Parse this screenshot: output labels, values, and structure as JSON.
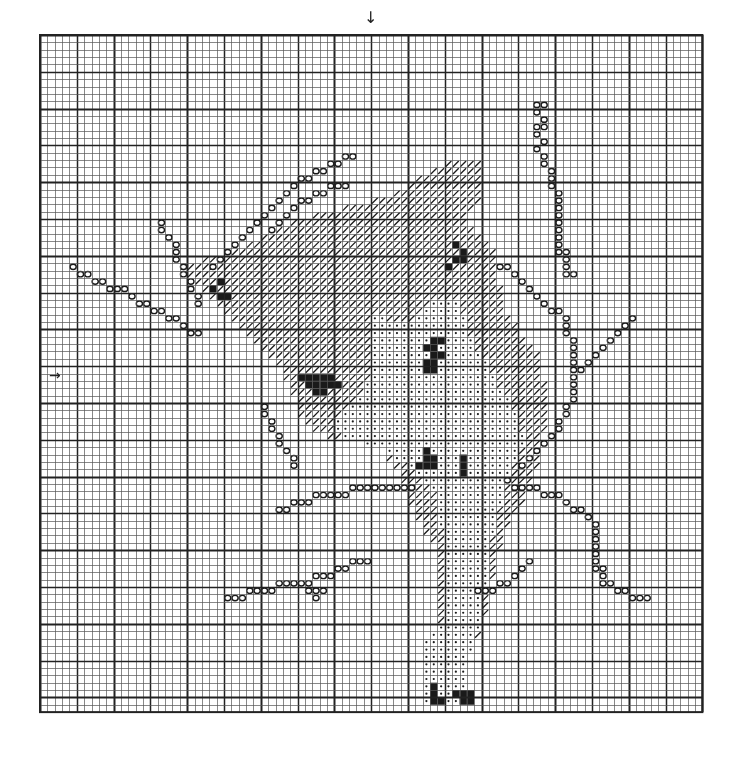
{
  "chart_title": "Cross-stitch pattern chart",
  "colors": {
    "grid_minor": "#555555",
    "grid_major": "#222222",
    "symbol_ink": "#1a1a1a",
    "background": "#ffffff"
  },
  "markers": {
    "center_top_arrow": "↓",
    "center_left_arrow": "→"
  },
  "grid": {
    "left": 40,
    "top": 35,
    "cols": 90,
    "rows": 92,
    "cell": 7.36,
    "major_every": 5,
    "heavy_every": 10
  },
  "legend_symbols": [
    {
      "id": "hatch",
      "name": "diagonal-hatch-symbol",
      "glyph": "/"
    },
    {
      "id": "dot",
      "name": "dot-symbol",
      "glyph": "·"
    },
    {
      "id": "circle",
      "name": "circle-symbol",
      "glyph": "o"
    },
    {
      "id": "solid",
      "name": "solid-black-symbol",
      "glyph": "■"
    }
  ],
  "regions": {
    "hatch": [
      [
        [
          25,
          30
        ],
        [
          35,
          25
        ],
        [
          47,
          22
        ],
        [
          56,
          17
        ],
        [
          60,
          17
        ],
        [
          60,
          22
        ],
        [
          58,
          25
        ],
        [
          62,
          30
        ],
        [
          63,
          37
        ],
        [
          68,
          44
        ],
        [
          69,
          50
        ],
        [
          68,
          58
        ],
        [
          66,
          63
        ],
        [
          63,
          68
        ],
        [
          62,
          72
        ],
        [
          60,
          82
        ],
        [
          57,
          85
        ],
        [
          54,
          84
        ],
        [
          54,
          70
        ],
        [
          51,
          65
        ],
        [
          49,
          60
        ],
        [
          46,
          55
        ],
        [
          40,
          55
        ],
        [
          36,
          53
        ],
        [
          34,
          48
        ],
        [
          32,
          44
        ],
        [
          28,
          40
        ],
        [
          24,
          36
        ],
        [
          20,
          33
        ],
        [
          19,
          32
        ],
        [
          20,
          31
        ]
      ]
    ],
    "dot": [
      [
        [
          45,
          38
        ],
        [
          50,
          39
        ],
        [
          54,
          36
        ],
        [
          57,
          36
        ],
        [
          58,
          40
        ],
        [
          61,
          45
        ],
        [
          64,
          50
        ],
        [
          66,
          55
        ],
        [
          63,
          62
        ],
        [
          61,
          70
        ],
        [
          60,
          80
        ],
        [
          58,
          86
        ],
        [
          58,
          91
        ],
        [
          52,
          91
        ],
        [
          52,
          83
        ],
        [
          55,
          80
        ],
        [
          55,
          70
        ],
        [
          54,
          63
        ],
        [
          52,
          60
        ],
        [
          49,
          58
        ],
        [
          46,
          56
        ],
        [
          42,
          55
        ],
        [
          39,
          53
        ],
        [
          43,
          50
        ],
        [
          45,
          46
        ]
      ]
    ],
    "solid_clusters": [
      [
        35,
        46
      ],
      [
        36,
        46
      ],
      [
        37,
        46
      ],
      [
        38,
        46
      ],
      [
        39,
        46
      ],
      [
        36,
        47
      ],
      [
        37,
        47
      ],
      [
        38,
        47
      ],
      [
        39,
        47
      ],
      [
        40,
        47
      ],
      [
        37,
        48
      ],
      [
        38,
        48
      ],
      [
        52,
        42
      ],
      [
        53,
        42
      ],
      [
        54,
        43
      ],
      [
        53,
        43
      ],
      [
        52,
        44
      ],
      [
        53,
        44
      ],
      [
        52,
        45
      ],
      [
        53,
        45
      ],
      [
        54,
        41
      ],
      [
        53,
        41
      ],
      [
        52,
        56
      ],
      [
        53,
        57
      ],
      [
        52,
        57
      ],
      [
        53,
        58
      ],
      [
        52,
        58
      ],
      [
        51,
        58
      ],
      [
        57,
        58
      ],
      [
        57,
        59
      ],
      [
        57,
        57
      ],
      [
        53,
        88
      ],
      [
        53,
        89
      ],
      [
        53,
        90
      ],
      [
        54,
        90
      ],
      [
        56,
        89
      ],
      [
        57,
        89
      ],
      [
        57,
        90
      ],
      [
        58,
        89
      ],
      [
        58,
        90
      ],
      [
        56,
        30
      ],
      [
        57,
        30
      ],
      [
        56,
        28
      ],
      [
        57,
        29
      ],
      [
        55,
        31
      ],
      [
        23,
        34
      ],
      [
        24,
        35
      ],
      [
        25,
        35
      ],
      [
        24,
        33
      ]
    ],
    "circles": [
      [
        4,
        31
      ],
      [
        5,
        32
      ],
      [
        6,
        32
      ],
      [
        7,
        33
      ],
      [
        8,
        33
      ],
      [
        9,
        34
      ],
      [
        10,
        34
      ],
      [
        11,
        34
      ],
      [
        12,
        35
      ],
      [
        13,
        36
      ],
      [
        14,
        36
      ],
      [
        15,
        37
      ],
      [
        16,
        37
      ],
      [
        17,
        38
      ],
      [
        18,
        38
      ],
      [
        19,
        39
      ],
      [
        20,
        40
      ],
      [
        21,
        40
      ],
      [
        16,
        25
      ],
      [
        16,
        26
      ],
      [
        17,
        27
      ],
      [
        18,
        28
      ],
      [
        18,
        29
      ],
      [
        18,
        30
      ],
      [
        19,
        31
      ],
      [
        19,
        32
      ],
      [
        20,
        33
      ],
      [
        20,
        34
      ],
      [
        21,
        35
      ],
      [
        21,
        36
      ],
      [
        23,
        31
      ],
      [
        24,
        30
      ],
      [
        25,
        29
      ],
      [
        26,
        28
      ],
      [
        27,
        27
      ],
      [
        28,
        26
      ],
      [
        29,
        25
      ],
      [
        30,
        24
      ],
      [
        31,
        23
      ],
      [
        32,
        22
      ],
      [
        33,
        21
      ],
      [
        34,
        20
      ],
      [
        35,
        19
      ],
      [
        36,
        19
      ],
      [
        37,
        18
      ],
      [
        38,
        18
      ],
      [
        39,
        17
      ],
      [
        40,
        17
      ],
      [
        41,
        16
      ],
      [
        42,
        16
      ],
      [
        31,
        26
      ],
      [
        32,
        25
      ],
      [
        33,
        24
      ],
      [
        34,
        23
      ],
      [
        35,
        22
      ],
      [
        36,
        22
      ],
      [
        37,
        21
      ],
      [
        38,
        21
      ],
      [
        39,
        20
      ],
      [
        40,
        20
      ],
      [
        41,
        20
      ],
      [
        30,
        50
      ],
      [
        30,
        51
      ],
      [
        31,
        52
      ],
      [
        31,
        53
      ],
      [
        32,
        54
      ],
      [
        32,
        55
      ],
      [
        33,
        56
      ],
      [
        34,
        57
      ],
      [
        34,
        58
      ],
      [
        67,
        9
      ],
      [
        68,
        9
      ],
      [
        67,
        10
      ],
      [
        68,
        11
      ],
      [
        67,
        12
      ],
      [
        68,
        12
      ],
      [
        67,
        13
      ],
      [
        68,
        14
      ],
      [
        67,
        15
      ],
      [
        68,
        16
      ],
      [
        68,
        17
      ],
      [
        69,
        18
      ],
      [
        69,
        19
      ],
      [
        69,
        20
      ],
      [
        70,
        21
      ],
      [
        70,
        22
      ],
      [
        70,
        23
      ],
      [
        70,
        24
      ],
      [
        70,
        25
      ],
      [
        70,
        26
      ],
      [
        70,
        27
      ],
      [
        70,
        28
      ],
      [
        70,
        29
      ],
      [
        71,
        29
      ],
      [
        71,
        30
      ],
      [
        71,
        31
      ],
      [
        71,
        32
      ],
      [
        72,
        32
      ],
      [
        62,
        31
      ],
      [
        63,
        31
      ],
      [
        64,
        32
      ],
      [
        65,
        33
      ],
      [
        66,
        34
      ],
      [
        67,
        35
      ],
      [
        68,
        36
      ],
      [
        69,
        37
      ],
      [
        70,
        37
      ],
      [
        71,
        38
      ],
      [
        71,
        39
      ],
      [
        71,
        40
      ],
      [
        72,
        41
      ],
      [
        72,
        42
      ],
      [
        72,
        43
      ],
      [
        72,
        44
      ],
      [
        72,
        45
      ],
      [
        72,
        46
      ],
      [
        72,
        47
      ],
      [
        72,
        48
      ],
      [
        72,
        49
      ],
      [
        71,
        50
      ],
      [
        71,
        51
      ],
      [
        70,
        52
      ],
      [
        70,
        53
      ],
      [
        69,
        54
      ],
      [
        68,
        55
      ],
      [
        67,
        56
      ],
      [
        66,
        57
      ],
      [
        65,
        58
      ],
      [
        73,
        45
      ],
      [
        74,
        44
      ],
      [
        75,
        43
      ],
      [
        76,
        42
      ],
      [
        77,
        41
      ],
      [
        78,
        40
      ],
      [
        79,
        39
      ],
      [
        80,
        38
      ],
      [
        63,
        60
      ],
      [
        64,
        61
      ],
      [
        65,
        61
      ],
      [
        66,
        61
      ],
      [
        67,
        61
      ],
      [
        68,
        62
      ],
      [
        69,
        62
      ],
      [
        70,
        62
      ],
      [
        71,
        63
      ],
      [
        72,
        64
      ],
      [
        73,
        64
      ],
      [
        74,
        65
      ],
      [
        75,
        66
      ],
      [
        75,
        67
      ],
      [
        75,
        68
      ],
      [
        75,
        69
      ],
      [
        75,
        70
      ],
      [
        75,
        71
      ],
      [
        75,
        72
      ],
      [
        76,
        72
      ],
      [
        76,
        73
      ],
      [
        76,
        74
      ],
      [
        77,
        74
      ],
      [
        78,
        75
      ],
      [
        79,
        75
      ],
      [
        80,
        76
      ],
      [
        81,
        76
      ],
      [
        82,
        76
      ],
      [
        32,
        64
      ],
      [
        33,
        64
      ],
      [
        34,
        63
      ],
      [
        35,
        63
      ],
      [
        36,
        63
      ],
      [
        37,
        62
      ],
      [
        38,
        62
      ],
      [
        39,
        62
      ],
      [
        40,
        62
      ],
      [
        41,
        62
      ],
      [
        42,
        61
      ],
      [
        43,
        61
      ],
      [
        44,
        61
      ],
      [
        45,
        61
      ],
      [
        46,
        61
      ],
      [
        47,
        61
      ],
      [
        48,
        61
      ],
      [
        49,
        61
      ],
      [
        50,
        61
      ],
      [
        25,
        76
      ],
      [
        26,
        76
      ],
      [
        27,
        76
      ],
      [
        28,
        75
      ],
      [
        29,
        75
      ],
      [
        30,
        75
      ],
      [
        31,
        75
      ],
      [
        32,
        74
      ],
      [
        33,
        74
      ],
      [
        34,
        74
      ],
      [
        35,
        74
      ],
      [
        36,
        74
      ],
      [
        37,
        73
      ],
      [
        38,
        73
      ],
      [
        39,
        73
      ],
      [
        40,
        72
      ],
      [
        41,
        72
      ],
      [
        42,
        71
      ],
      [
        43,
        71
      ],
      [
        44,
        71
      ],
      [
        36,
        75
      ],
      [
        37,
        75
      ],
      [
        38,
        75
      ],
      [
        37,
        76
      ],
      [
        59,
        75
      ],
      [
        60,
        75
      ],
      [
        61,
        75
      ],
      [
        62,
        74
      ],
      [
        63,
        74
      ],
      [
        64,
        73
      ],
      [
        65,
        72
      ],
      [
        66,
        71
      ]
    ]
  }
}
